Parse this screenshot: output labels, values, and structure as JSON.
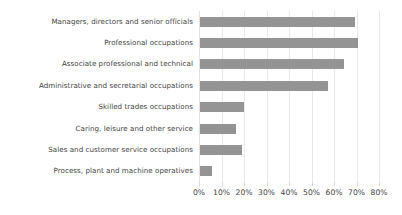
{
  "chart_data": {
    "type": "bar",
    "orientation": "horizontal",
    "title": "",
    "subtitle": "",
    "xlabel": "",
    "ylabel": "",
    "xlim": [
      0,
      80
    ],
    "tick_labels": [
      "0%",
      "10%",
      "20%",
      "30%",
      "40%",
      "50%",
      "60%",
      "70%",
      "80%"
    ],
    "tick_values": [
      0,
      10,
      20,
      30,
      40,
      50,
      60,
      70,
      80
    ],
    "grid": true,
    "legend": false,
    "legend_position": "none",
    "bar_color": "#949494",
    "gridline_color": "#e9e9e9",
    "text_color": "#3f3f3f",
    "categories": [
      "Managers, directors and senior officials",
      "Professional occupations",
      "Associate professional and technical",
      "Administrative and secretarial occupations",
      "Skilled trades occupations",
      "Caring, leisure and other service",
      "Sales and customer service occupations",
      "Process, plant and machine operatives"
    ],
    "values": [
      69,
      70,
      64,
      57,
      19.5,
      16,
      18.5,
      5.5
    ]
  }
}
